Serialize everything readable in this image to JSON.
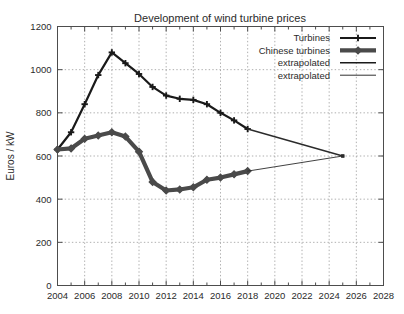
{
  "chart_data": {
    "type": "line",
    "title": "Development of wind turbine prices",
    "xlabel": "",
    "ylabel": "Euros / kW",
    "xlim": [
      2004,
      2028
    ],
    "ylim": [
      0,
      1200
    ],
    "xticks": [
      2004,
      2006,
      2008,
      2010,
      2012,
      2014,
      2016,
      2018,
      2020,
      2022,
      2024,
      2026,
      2028
    ],
    "yticks": [
      0,
      200,
      400,
      600,
      800,
      1000,
      1200
    ],
    "grid": true,
    "legend_position": "top-right",
    "series": [
      {
        "name": "Turbines",
        "style": "thick-plus",
        "color": "#1a1a1a",
        "x": [
          2004,
          2005,
          2006,
          2007,
          2008,
          2009,
          2010,
          2011,
          2012,
          2013,
          2014,
          2015,
          2016,
          2017,
          2018
        ],
        "values": [
          630,
          710,
          840,
          975,
          1080,
          1030,
          980,
          920,
          880,
          865,
          860,
          840,
          800,
          765,
          725
        ]
      },
      {
        "name": "Chinese turbines",
        "style": "thick-diamond",
        "color": "#4a4a4a",
        "x": [
          2004,
          2005,
          2006,
          2007,
          2008,
          2009,
          2010,
          2011,
          2012,
          2013,
          2014,
          2015,
          2016,
          2017,
          2018
        ],
        "values": [
          630,
          635,
          680,
          695,
          710,
          690,
          620,
          480,
          440,
          445,
          455,
          490,
          500,
          515,
          530
        ]
      },
      {
        "name": "extrapolated",
        "style": "medium",
        "color": "#2b2b2b",
        "x": [
          2018,
          2025
        ],
        "values": [
          725,
          600
        ]
      },
      {
        "name": "extrapolated",
        "style": "thin",
        "color": "#2b2b2b",
        "x": [
          2018,
          2025
        ],
        "values": [
          530,
          600
        ]
      }
    ],
    "legend": [
      {
        "label": "Turbines",
        "style": "thick-plus"
      },
      {
        "label": "Chinese turbines",
        "style": "thick-diamond"
      },
      {
        "label": "extrapolated",
        "style": "medium"
      },
      {
        "label": "extrapolated",
        "style": "thin"
      }
    ]
  },
  "colors": {
    "axis": "#4d4d4d",
    "grid": "#9a9a9a",
    "series_primary": "#1a1a1a",
    "series_secondary": "#4a4a4a",
    "background": "#ffffff"
  }
}
